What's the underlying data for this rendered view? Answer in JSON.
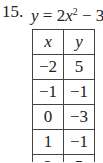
{
  "problem": {
    "number": "15.",
    "equation": {
      "lhs": "y",
      "equals": " = 2",
      "var": "x",
      "exponent": "2",
      "rest": " − 3"
    }
  },
  "table": {
    "headers": [
      "x",
      "y"
    ],
    "rows": [
      [
        "−2",
        "5"
      ],
      [
        "−1",
        "−1"
      ],
      [
        "0",
        "−3"
      ],
      [
        "1",
        "−1"
      ],
      [
        "2",
        "5"
      ]
    ]
  }
}
